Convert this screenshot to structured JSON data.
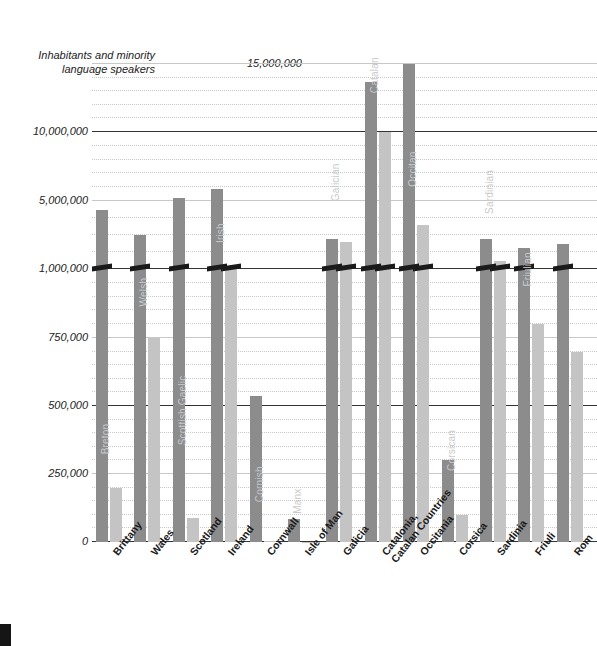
{
  "chart_data": {
    "type": "bar",
    "title": "",
    "ylabel": "Inhabitants and minority language speakers",
    "xlabel": "",
    "grid": true,
    "legend_position": "none",
    "axis_note": "broken axis: linear 0-1,000,000 then compressed 1,000,000-15,000,000",
    "ytick_labels": [
      "15,000,000",
      "10,000,000",
      "5,000,000",
      "1,000,000",
      "750,000",
      "500,000",
      "250,000",
      "0"
    ],
    "ytick_values": [
      15000000,
      10000000,
      5000000,
      1000000,
      750000,
      500000,
      250000,
      0
    ],
    "categories": [
      "Brittany",
      "Wales",
      "Scotland",
      "Ireland",
      "Cornwall",
      "Isle of Man",
      "Galicia",
      "Catalonia,\nCatalan Countries",
      "Occitania",
      "Corsica",
      "Sardinia",
      "Friuli",
      "Rom"
    ],
    "series": [
      {
        "name": "Inhabitants",
        "color": "#8c8c8c",
        "values": [
          4500000,
          3000000,
          5200000,
          5900000,
          535000,
          85000,
          2750000,
          13700000,
          15000000,
          300000,
          2750000,
          2250000,
          2500000
        ]
      },
      {
        "name": "Minority language speakers",
        "color": "#c4c4c4",
        "values": [
          200000,
          750000,
          90000,
          1200000,
          3000,
          1800,
          2600000,
          10000000,
          3600000,
          100000,
          1500000,
          800000,
          700000
        ]
      }
    ],
    "speaker_labels": [
      "Breton",
      "Welsh",
      "Scottish Gaelic",
      "Irish",
      "Cornish",
      "Manx",
      "Galician",
      "Catalan",
      "Occitan",
      "Corsican",
      "Sardinian",
      "Friulian",
      ""
    ]
  },
  "page": {
    "corner_marker": ""
  }
}
